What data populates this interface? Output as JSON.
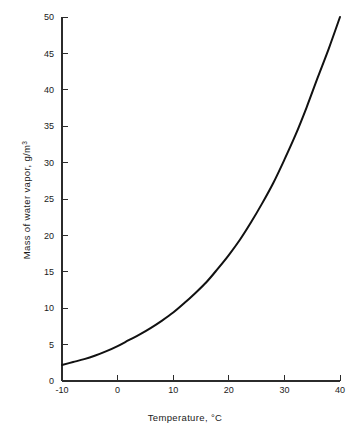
{
  "chart_data": {
    "type": "line",
    "title": "",
    "subtitle": "",
    "xlabel": "Temperature, °C",
    "ylabel": "Mass of water vapor, g/m³",
    "xlabel_main": "Temperature, ",
    "xlabel_unit": "°C",
    "ylabel_main": "Mass of water vapor, g/m",
    "ylabel_exponent": "3",
    "xlim": [
      -10,
      40
    ],
    "ylim": [
      0,
      50
    ],
    "grid": false,
    "legend": false,
    "legend_position": "none",
    "x_ticks": [
      -10,
      0,
      10,
      20,
      30,
      40
    ],
    "x_tick_labels": [
      "-10",
      "0",
      "10",
      "20",
      "30",
      "40"
    ],
    "y_ticks": [
      0,
      5,
      10,
      15,
      20,
      25,
      30,
      35,
      40,
      45,
      50
    ],
    "y_tick_labels": [
      "0",
      "5",
      "10",
      "15",
      "20",
      "25",
      "30",
      "35",
      "40",
      "45",
      "50"
    ],
    "x": [
      -10,
      -8,
      -6,
      -4,
      -2,
      0,
      2,
      4,
      6,
      8,
      10,
      12,
      14,
      16,
      18,
      20,
      22,
      24,
      26,
      28,
      30,
      32,
      34,
      36,
      38,
      40
    ],
    "y": [
      2.2,
      2.6,
      3.0,
      3.5,
      4.1,
      4.8,
      5.6,
      6.4,
      7.3,
      8.3,
      9.4,
      10.7,
      12.1,
      13.6,
      15.4,
      17.3,
      19.4,
      21.8,
      24.4,
      27.2,
      30.4,
      33.8,
      37.6,
      41.7,
      45.7,
      50.0
    ],
    "series": [
      {
        "name": "Saturated water vapor density",
        "color": "#111111",
        "values": [
          2.2,
          2.6,
          3.0,
          3.5,
          4.1,
          4.8,
          5.6,
          6.4,
          7.3,
          8.3,
          9.4,
          10.7,
          12.1,
          13.6,
          15.4,
          17.3,
          19.4,
          21.8,
          24.4,
          27.2,
          30.4,
          33.8,
          37.6,
          41.7,
          45.7,
          50.0
        ]
      }
    ],
    "annotations": []
  }
}
